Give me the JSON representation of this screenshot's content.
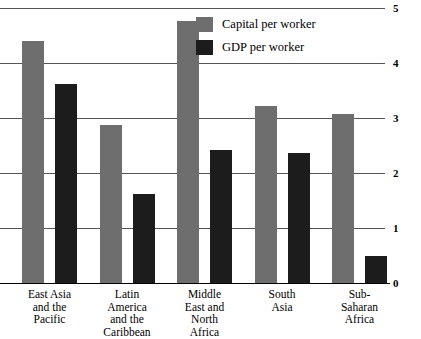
{
  "chart_data": {
    "type": "bar",
    "title": "",
    "subtitle": "",
    "xlabel": "",
    "ylabel": "",
    "ylim": [
      0,
      5
    ],
    "yticks": [
      0,
      1,
      2,
      3,
      4,
      5
    ],
    "ytick_labels": [
      "0",
      "1",
      "2",
      "3",
      "4",
      "5"
    ],
    "grid": true,
    "grid_axis": "y",
    "legend_position": "top-center-right",
    "categories": [
      "East Asia and the Pacific",
      "Latin America and the Caribbean",
      "Middle East and North Africa",
      "South Asia",
      "Sub-Saharan Africa"
    ],
    "category_label_lines": [
      [
        "East Asia",
        "and the",
        "Pacific"
      ],
      [
        "Latin",
        "America",
        "and the",
        "Caribbean"
      ],
      [
        "Middle",
        "East and",
        "North",
        "Africa"
      ],
      [
        "South",
        "Asia"
      ],
      [
        "Sub-",
        "Saharan",
        "Africa"
      ]
    ],
    "series": [
      {
        "name": "Capital per worker",
        "color": "#6e6e6e",
        "values": [
          4.4,
          2.87,
          4.76,
          3.22,
          3.07
        ]
      },
      {
        "name": "GDP per worker",
        "color": "#1c1c1c",
        "values": [
          3.62,
          1.62,
          2.42,
          2.36,
          0.49
        ]
      }
    ]
  },
  "legend": {
    "items": [
      {
        "label": "Capital per worker",
        "color": "#6e6e6e"
      },
      {
        "label": "GDP per worker",
        "color": "#1c1c1c"
      }
    ]
  },
  "axis": {
    "y": {
      "ticks": [
        "0",
        "1",
        "2",
        "3",
        "4",
        "5"
      ]
    }
  },
  "colors": {
    "capital": "#6e6e6e",
    "gdp": "#1c1c1c",
    "gridline": "#555555",
    "baseline": "#000000",
    "background": "#ffffff",
    "text": "#000000"
  }
}
